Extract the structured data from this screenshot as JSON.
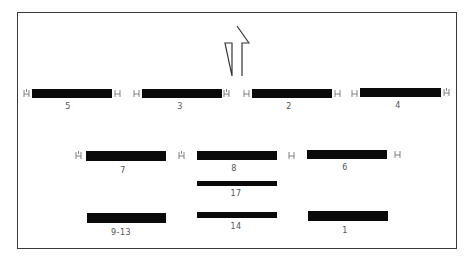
{
  "diagram": {
    "arrow": {
      "direction": "up"
    },
    "rows": [
      {
        "name": "row-1",
        "bars": [
          {
            "label": "5",
            "x": 32,
            "y": 89,
            "w": 80,
            "h": 9,
            "ticks": [
              22,
              116
            ]
          },
          {
            "label": "3",
            "x": 142,
            "y": 89,
            "w": 80,
            "h": 9,
            "ticks": [
              132,
              225
            ]
          },
          {
            "label": "2",
            "x": 252,
            "y": 89,
            "w": 80,
            "h": 9,
            "ticks": [
              242,
              335
            ]
          },
          {
            "label": "4",
            "x": 360,
            "y": 88,
            "w": 81,
            "h": 9,
            "ticks": [
              351,
              445
            ]
          }
        ]
      },
      {
        "name": "row-2",
        "bars": [
          {
            "label": "7",
            "x": 86,
            "y": 151,
            "w": 80,
            "h": 10,
            "ticks": [
              75,
              179
            ]
          },
          {
            "label": "8",
            "x": 197,
            "y": 151,
            "w": 80,
            "h": 9,
            "ticks": [
              288
            ]
          },
          {
            "label": "6",
            "x": 307,
            "y": 150,
            "w": 80,
            "h": 9,
            "ticks": [
              394
            ]
          }
        ]
      },
      {
        "name": "row-3",
        "bars": [
          {
            "label": "17",
            "x": 197,
            "y": 181,
            "w": 80,
            "h": 5,
            "ticks": []
          }
        ]
      },
      {
        "name": "row-4",
        "bars": [
          {
            "label": "9-13",
            "x": 87,
            "y": 213,
            "w": 79,
            "h": 10,
            "ticks": []
          },
          {
            "label": "14",
            "x": 197,
            "y": 212,
            "w": 80,
            "h": 6,
            "ticks": []
          },
          {
            "label": "1",
            "x": 308,
            "y": 211,
            "w": 80,
            "h": 10,
            "ticks": []
          }
        ]
      }
    ],
    "labels": {
      "b5": "5",
      "b3": "3",
      "b2": "2",
      "b4": "4",
      "b7": "7",
      "b8": "8",
      "b6": "6",
      "b17": "17",
      "b9_13": "9-13",
      "b14": "14",
      "b1": "1"
    }
  }
}
